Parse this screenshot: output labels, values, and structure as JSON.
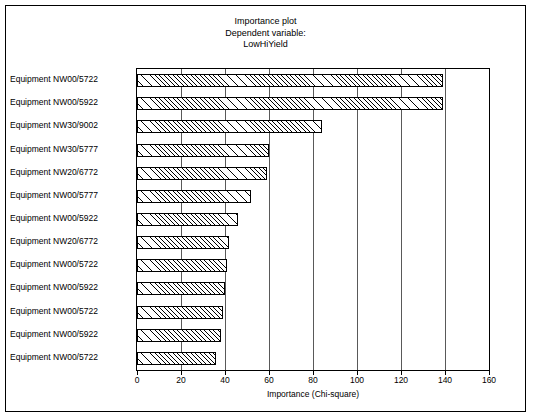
{
  "chart_data": {
    "type": "bar",
    "orientation": "horizontal",
    "title": "Importance plot",
    "subtitle": "Dependent variable:",
    "subtitle2": "LowHiYield",
    "xlabel": "Importance (Chi-square)",
    "ylabel": "",
    "xlim": [
      0,
      160
    ],
    "xticks": [
      0,
      20,
      40,
      60,
      80,
      100,
      120,
      140,
      160
    ],
    "grid": true,
    "legend": false,
    "categories": [
      "Equipment NW00/5722",
      "Equipment NW00/5922",
      "Equipment NW30/9002",
      "Equipment NW30/5777",
      "Equipment NW20/6772",
      "Equipment NW00/5777",
      "Equipment NW00/5922",
      "Equipment NW20/6772",
      "Equipment NW00/5722",
      "Equipment NW00/5922",
      "Equipment NW00/5722",
      "Equipment NW00/5922",
      "Equipment NW00/5722"
    ],
    "values": [
      139,
      139,
      84,
      60,
      59,
      52,
      46,
      42,
      41,
      40,
      39,
      38,
      36
    ],
    "bar_fill": "hatched",
    "bar_color": "#000000"
  }
}
